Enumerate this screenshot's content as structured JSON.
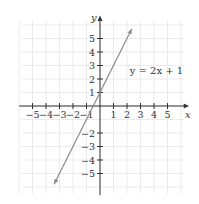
{
  "chart_data": {
    "type": "line",
    "title": "",
    "xlabel": "x",
    "ylabel": "y",
    "xlim": [
      -6,
      6.5
    ],
    "ylim": [
      -6.5,
      6.5
    ],
    "grid": true,
    "x_ticks": [
      -5,
      -4,
      -3,
      -2,
      -1,
      1,
      2,
      3,
      4,
      5
    ],
    "y_ticks": [
      -5,
      -4,
      -3,
      -2,
      1,
      2,
      3,
      4,
      5
    ],
    "x_tick_labels": [
      "−5",
      "−4",
      "−3",
      "−2",
      "−1",
      "1",
      "2",
      "3",
      "4",
      "5"
    ],
    "y_tick_labels": [
      "−5",
      "−4",
      "−3",
      "−2",
      "1",
      "2",
      "3",
      "4",
      "5"
    ],
    "series": [
      {
        "name": "y = 2x + 1",
        "equation": "y = 2x + 1",
        "slope": 2,
        "intercept": 1,
        "x": [
          -3.4,
          2.35
        ],
        "y": [
          -5.8,
          5.7
        ],
        "arrows": "both",
        "color": "#8a8a8a"
      }
    ],
    "annotations": [
      {
        "text": "y = 2x + 1",
        "x": 2.2,
        "y": 2.6
      }
    ]
  },
  "colors": {
    "axis": "#333333",
    "grid": "#e6e6e6",
    "line": "#8a8a8a",
    "text": "#333333"
  }
}
